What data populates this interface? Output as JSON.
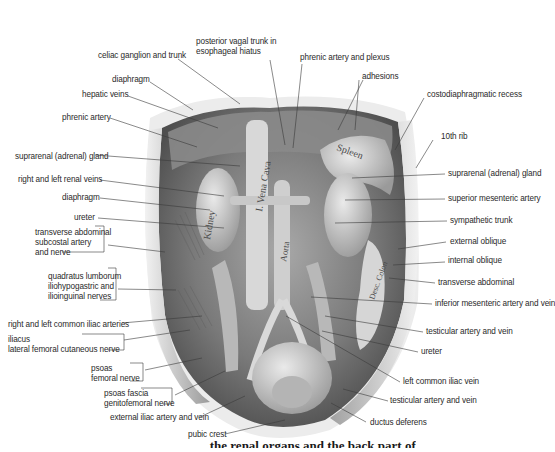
{
  "figure": {
    "type": "anatomical illustration",
    "colors": {
      "background": "#ffffff",
      "label_text": "#2a2a2a",
      "leader_line": "#3a3a3a",
      "tissue_dark": "#4a4a4a",
      "tissue_mid": "#8c8c8c",
      "tissue_light": "#d4d4d4"
    },
    "organ_labels": {
      "kidney": "Kidney",
      "vena_cava": "I. Vena Cava",
      "aorta": "Aorta",
      "spleen": "Spleen",
      "colon": "Desc. Colon"
    },
    "caption_partial": "...the renal organs and the back part of"
  },
  "labels_top": [
    {
      "id": "celiac",
      "text": "celiac ganglion and trunk"
    },
    {
      "id": "vagal",
      "text": "posterior vagal trunk in\nesophageal hiatus"
    },
    {
      "id": "phrenic_plexus",
      "text": "phrenic artery and plexus"
    },
    {
      "id": "adhesions",
      "text": "adhesions"
    },
    {
      "id": "costo",
      "text": "costodiaphragmatic recess"
    }
  ],
  "labels_left": [
    {
      "id": "diaphragm1",
      "text": "diaphragm"
    },
    {
      "id": "hepatic",
      "text": "hepatic veins"
    },
    {
      "id": "phrenic_a",
      "text": "phrenic artery"
    },
    {
      "id": "suprarenal_l",
      "text": "suprarenal (adrenal) gland"
    },
    {
      "id": "renal_veins",
      "text": "right and left renal veins"
    },
    {
      "id": "diaphragm2",
      "text": "diaphragm"
    },
    {
      "id": "ureter_l",
      "text": "ureter"
    },
    {
      "id": "transverse_grp",
      "text": "transverse abdominal\nsubcostal artery\nand nerve"
    },
    {
      "id": "quadratus_grp",
      "text": "quadratus lumborum\niliohypogastric and\nilioinguinal nerves"
    },
    {
      "id": "common_iliac",
      "text": "right and left common iliac arteries"
    },
    {
      "id": "iliacus_grp",
      "text": "iliacus\nlateral femoral cutaneous nerve"
    },
    {
      "id": "psoas_grp",
      "text": "psoas\nfemoral nerve"
    },
    {
      "id": "psoas_fascia_grp",
      "text": "psoas fascia\ngenitofemoral nerve"
    },
    {
      "id": "ext_iliac",
      "text": "external iliac artery and vein"
    },
    {
      "id": "pubic",
      "text": "pubic crest"
    }
  ],
  "labels_right": [
    {
      "id": "rib10",
      "text": "10th rib"
    },
    {
      "id": "suprarenal_r",
      "text": "suprarenal (adrenal) gland"
    },
    {
      "id": "sup_mes",
      "text": "superior mesenteric artery"
    },
    {
      "id": "symp",
      "text": "sympathetic trunk"
    },
    {
      "id": "ext_obl",
      "text": "external oblique"
    },
    {
      "id": "int_obl",
      "text": "internal oblique"
    },
    {
      "id": "trans_abd",
      "text": "transverse abdominal"
    },
    {
      "id": "inf_mes",
      "text": "inferior mesenteric artery and vein"
    },
    {
      "id": "testic1",
      "text": "testicular artery and vein"
    },
    {
      "id": "ureter_r",
      "text": "ureter"
    },
    {
      "id": "l_common_iliac_v",
      "text": "left common iliac vein"
    },
    {
      "id": "testic2",
      "text": "testicular artery and vein"
    },
    {
      "id": "ductus",
      "text": "ductus deferens"
    }
  ]
}
